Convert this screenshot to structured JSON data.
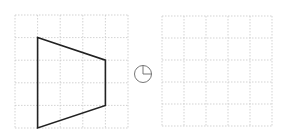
{
  "figure": {
    "left_grid": {
      "x": 15,
      "y": 15,
      "cols": 5,
      "rows": 5,
      "cell": 22.6
    },
    "right_grid": {
      "x": 162,
      "y": 16,
      "cols": 5,
      "rows": 5,
      "cell": 22.0
    },
    "shape": {
      "type": "trapezoid",
      "grid_vertices": [
        [
          1,
          1
        ],
        [
          4,
          2
        ],
        [
          4,
          4
        ],
        [
          1,
          5
        ]
      ],
      "stroke": "#222222"
    },
    "rotation_symbol": {
      "cx": 143,
      "cy": 74,
      "r": 8.5,
      "meaning": "quarter-turn rotation",
      "color": "#555555"
    },
    "grid_color": "#c8c8c8"
  }
}
